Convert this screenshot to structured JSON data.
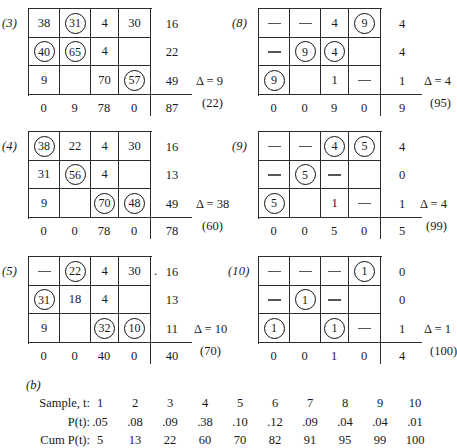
{
  "figure": {
    "part_b_label": "(b)"
  },
  "panels": [
    {
      "label": "(3)",
      "rows": [
        [
          {
            "v": "38",
            "c": false
          },
          {
            "v": "31",
            "c": true
          },
          {
            "v": "4",
            "c": false
          },
          {
            "v": "30",
            "c": false
          }
        ],
        [
          {
            "v": "40",
            "c": true
          },
          {
            "v": "65",
            "c": true
          },
          {
            "v": "4",
            "c": false
          },
          {
            "v": "",
            "c": false
          }
        ],
        [
          {
            "v": "9",
            "c": false
          },
          {
            "v": "",
            "c": false
          },
          {
            "v": "70",
            "c": false
          },
          {
            "v": "57",
            "c": true
          }
        ]
      ],
      "row_sums": [
        "16",
        "22",
        "49"
      ],
      "col_sums": [
        "0",
        "9",
        "78",
        "0"
      ],
      "grand_sum": "87",
      "delta": "Δ = 9",
      "paren": "(22)",
      "lead_dot": ""
    },
    {
      "label": "(8)",
      "rows": [
        [
          {
            "v": "—",
            "c": false,
            "d": true
          },
          {
            "v": "—",
            "c": false,
            "d": true
          },
          {
            "v": "4",
            "c": false
          },
          {
            "v": "9",
            "c": true
          }
        ],
        [
          {
            "v": "—",
            "c": false,
            "d": true
          },
          {
            "v": "9",
            "c": true
          },
          {
            "v": "4",
            "c": true
          },
          {
            "v": "",
            "c": false
          }
        ],
        [
          {
            "v": "9",
            "c": true
          },
          {
            "v": "",
            "c": false
          },
          {
            "v": "1",
            "c": false
          },
          {
            "v": "—",
            "c": false,
            "d": true
          }
        ]
      ],
      "row_sums": [
        "4",
        "4",
        "1"
      ],
      "col_sums": [
        "0",
        "0",
        "9",
        "0"
      ],
      "grand_sum": "9",
      "delta": "Δ = 4",
      "paren": "(95)",
      "lead_dot": ""
    },
    {
      "label": "(4)",
      "rows": [
        [
          {
            "v": "38",
            "c": true
          },
          {
            "v": "22",
            "c": false
          },
          {
            "v": "4",
            "c": false
          },
          {
            "v": "30",
            "c": false
          }
        ],
        [
          {
            "v": "31",
            "c": false
          },
          {
            "v": "56",
            "c": true
          },
          {
            "v": "4",
            "c": false
          },
          {
            "v": "",
            "c": false
          }
        ],
        [
          {
            "v": "9",
            "c": false
          },
          {
            "v": "",
            "c": false
          },
          {
            "v": "70",
            "c": true
          },
          {
            "v": "48",
            "c": true
          }
        ]
      ],
      "row_sums": [
        "16",
        "13",
        "49"
      ],
      "col_sums": [
        "0",
        "0",
        "78",
        "0"
      ],
      "grand_sum": "78",
      "delta": "Δ = 38",
      "paren": "(60)",
      "lead_dot": ""
    },
    {
      "label": "(9)",
      "rows": [
        [
          {
            "v": "—",
            "c": false,
            "d": true
          },
          {
            "v": "—",
            "c": false,
            "d": true
          },
          {
            "v": "4",
            "c": true
          },
          {
            "v": "5",
            "c": true
          }
        ],
        [
          {
            "v": "—",
            "c": false,
            "d": true
          },
          {
            "v": "5",
            "c": true
          },
          {
            "v": "—",
            "c": false,
            "d": true
          },
          {
            "v": "",
            "c": false
          }
        ],
        [
          {
            "v": "5",
            "c": true
          },
          {
            "v": "",
            "c": false
          },
          {
            "v": "1",
            "c": false
          },
          {
            "v": "—",
            "c": false,
            "d": true
          }
        ]
      ],
      "row_sums": [
        "4",
        "0",
        "1"
      ],
      "col_sums": [
        "0",
        "0",
        "5",
        "0"
      ],
      "grand_sum": "5",
      "delta": "Δ = 4",
      "paren": "(99)",
      "lead_dot": ""
    },
    {
      "label": "(5)",
      "rows": [
        [
          {
            "v": "—",
            "c": false,
            "d": true
          },
          {
            "v": "22",
            "c": true
          },
          {
            "v": "4",
            "c": false
          },
          {
            "v": "30",
            "c": false
          }
        ],
        [
          {
            "v": "31",
            "c": true
          },
          {
            "v": "18",
            "c": false
          },
          {
            "v": "4",
            "c": false
          },
          {
            "v": "",
            "c": false
          }
        ],
        [
          {
            "v": "9",
            "c": false
          },
          {
            "v": "",
            "c": false
          },
          {
            "v": "32",
            "c": true
          },
          {
            "v": "10",
            "c": true
          }
        ]
      ],
      "row_sums": [
        "16",
        "13",
        "11"
      ],
      "col_sums": [
        "0",
        "0",
        "40",
        "0"
      ],
      "grand_sum": "40",
      "delta": "Δ = 10",
      "paren": "(70)",
      "lead_dot": "."
    },
    {
      "label": "(10)",
      "rows": [
        [
          {
            "v": "—",
            "c": false,
            "d": true
          },
          {
            "v": "—",
            "c": false,
            "d": true
          },
          {
            "v": "—",
            "c": false,
            "d": true
          },
          {
            "v": "1",
            "c": true
          }
        ],
        [
          {
            "v": "—",
            "c": false,
            "d": true
          },
          {
            "v": "1",
            "c": true
          },
          {
            "v": "—",
            "c": false,
            "d": true
          },
          {
            "v": "",
            "c": false
          }
        ],
        [
          {
            "v": "1",
            "c": true
          },
          {
            "v": "",
            "c": false
          },
          {
            "v": "1",
            "c": true
          },
          {
            "v": "—",
            "c": false,
            "d": true
          }
        ]
      ],
      "row_sums": [
        "0",
        "0",
        "1"
      ],
      "col_sums": [
        "0",
        "0",
        "1",
        "0"
      ],
      "grand_sum": "4",
      "delta": "Δ = 1",
      "paren": "(100)",
      "lead_dot": ""
    }
  ],
  "prob_table": {
    "row_labels": [
      "Sample, t:",
      "P(t):",
      "Cum P(t):"
    ],
    "samples": [
      "1",
      "2",
      "3",
      "4",
      "5",
      "6",
      "7",
      "8",
      "9",
      "10"
    ],
    "probabilities": [
      ".05",
      ".08",
      ".09",
      ".38",
      ".10",
      ".12",
      ".09",
      ".04",
      ".04",
      ".01"
    ],
    "cumulative": [
      "5",
      "13",
      "22",
      "60",
      "70",
      "82",
      "91",
      "95",
      "99",
      "100"
    ]
  },
  "chart_data": {
    "type": "table",
    "tableaus": [
      {
        "label": "(3)",
        "delta": 9,
        "cumulative": 22,
        "matrix": [
          [
            "38",
            "31",
            "4",
            "30"
          ],
          [
            "40",
            "65",
            "4",
            ""
          ],
          [
            "9",
            "",
            "70",
            "57"
          ]
        ],
        "circled": [
          [
            false,
            true,
            false,
            false
          ],
          [
            true,
            true,
            false,
            false
          ],
          [
            false,
            false,
            false,
            true
          ]
        ],
        "row_sums": [
          16,
          22,
          49
        ],
        "col_sums": [
          0,
          9,
          78,
          0
        ],
        "total": 87
      },
      {
        "label": "(8)",
        "delta": 4,
        "cumulative": 95,
        "matrix": [
          [
            "—",
            "—",
            "4",
            "9"
          ],
          [
            "—",
            "9",
            "4",
            ""
          ],
          [
            "9",
            "",
            "1",
            "—"
          ]
        ],
        "circled": [
          [
            false,
            false,
            false,
            true
          ],
          [
            false,
            true,
            true,
            false
          ],
          [
            true,
            false,
            false,
            false
          ]
        ],
        "row_sums": [
          4,
          4,
          1
        ],
        "col_sums": [
          0,
          0,
          9,
          0
        ],
        "total": 9
      },
      {
        "label": "(4)",
        "delta": 38,
        "cumulative": 60,
        "matrix": [
          [
            "38",
            "22",
            "4",
            "30"
          ],
          [
            "31",
            "56",
            "4",
            ""
          ],
          [
            "9",
            "",
            "70",
            "48"
          ]
        ],
        "circled": [
          [
            true,
            false,
            false,
            false
          ],
          [
            false,
            true,
            false,
            false
          ],
          [
            false,
            false,
            true,
            true
          ]
        ],
        "row_sums": [
          16,
          13,
          49
        ],
        "col_sums": [
          0,
          0,
          78,
          0
        ],
        "total": 78
      },
      {
        "label": "(9)",
        "delta": 4,
        "cumulative": 99,
        "matrix": [
          [
            "—",
            "—",
            "4",
            "5"
          ],
          [
            "—",
            "5",
            "—",
            ""
          ],
          [
            "5",
            "",
            "1",
            "—"
          ]
        ],
        "circled": [
          [
            false,
            false,
            true,
            true
          ],
          [
            false,
            true,
            false,
            false
          ],
          [
            true,
            false,
            false,
            false
          ]
        ],
        "row_sums": [
          4,
          0,
          1
        ],
        "col_sums": [
          0,
          0,
          5,
          0
        ],
        "total": 5
      },
      {
        "label": "(5)",
        "delta": 10,
        "cumulative": 70,
        "matrix": [
          [
            "—",
            "22",
            "4",
            "30"
          ],
          [
            "31",
            "18",
            "4",
            ""
          ],
          [
            "9",
            "",
            "32",
            "10"
          ]
        ],
        "circled": [
          [
            false,
            true,
            false,
            false
          ],
          [
            true,
            false,
            false,
            false
          ],
          [
            false,
            false,
            true,
            true
          ]
        ],
        "row_sums": [
          16,
          13,
          11
        ],
        "col_sums": [
          0,
          0,
          40,
          0
        ],
        "total": 40
      },
      {
        "label": "(10)",
        "delta": 1,
        "cumulative": 100,
        "matrix": [
          [
            "—",
            "—",
            "—",
            "1"
          ],
          [
            "—",
            "1",
            "—",
            ""
          ],
          [
            "1",
            "",
            "1",
            "—"
          ]
        ],
        "circled": [
          [
            false,
            false,
            false,
            true
          ],
          [
            false,
            true,
            false,
            false
          ],
          [
            true,
            false,
            true,
            false
          ]
        ],
        "row_sums": [
          0,
          0,
          1
        ],
        "col_sums": [
          0,
          0,
          1,
          0
        ],
        "total": 4
      }
    ],
    "distribution": {
      "x": [
        1,
        2,
        3,
        4,
        5,
        6,
        7,
        8,
        9,
        10
      ],
      "series": [
        {
          "name": "P(t)",
          "values": [
            0.05,
            0.08,
            0.09,
            0.38,
            0.1,
            0.12,
            0.09,
            0.04,
            0.04,
            0.01
          ]
        },
        {
          "name": "Cum P(t)",
          "values": [
            5,
            13,
            22,
            60,
            70,
            82,
            91,
            95,
            99,
            100
          ]
        }
      ],
      "xlabel": "Sample, t"
    }
  }
}
